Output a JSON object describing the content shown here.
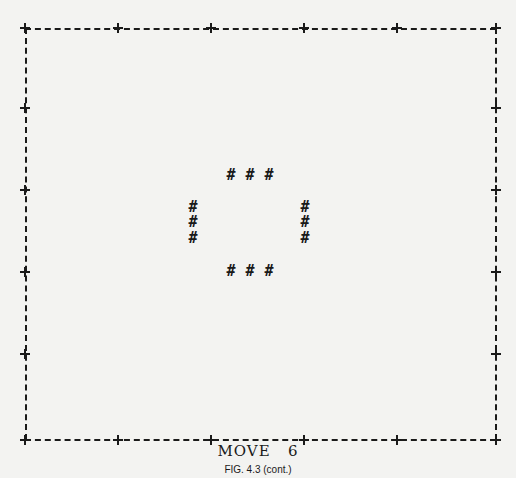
{
  "figure": {
    "move_label": "MOVE",
    "move_number": "6",
    "caption": "FIG. 4.3 (cont.)"
  },
  "board": {
    "border_char": "-",
    "corner_char": "+",
    "cell_char": "#",
    "live_cells": [
      {
        "x": 231,
        "y": 175
      },
      {
        "x": 250,
        "y": 175
      },
      {
        "x": 269,
        "y": 175
      },
      {
        "x": 193,
        "y": 207
      },
      {
        "x": 193,
        "y": 222
      },
      {
        "x": 193,
        "y": 238
      },
      {
        "x": 305,
        "y": 207
      },
      {
        "x": 305,
        "y": 222
      },
      {
        "x": 305,
        "y": 238
      },
      {
        "x": 231,
        "y": 271
      },
      {
        "x": 250,
        "y": 271
      },
      {
        "x": 269,
        "y": 271
      }
    ]
  }
}
